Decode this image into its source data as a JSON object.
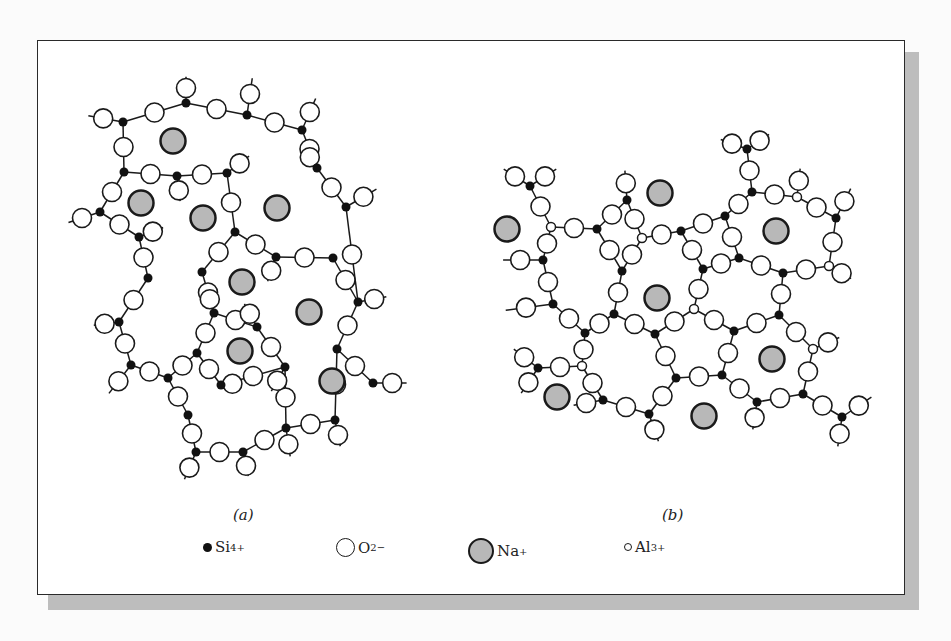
{
  "figure": {
    "panels": [
      {
        "id": "a",
        "caption": "(a)",
        "caption_pos": [
          243,
          516
        ]
      },
      {
        "id": "b",
        "caption": "(b)",
        "caption_pos": [
          672,
          516
        ]
      }
    ],
    "legend": [
      {
        "symbol": "si",
        "label": "Si",
        "charge": "4+",
        "x": 203
      },
      {
        "symbol": "o",
        "label": "O",
        "charge": "2−",
        "x": 336
      },
      {
        "symbol": "na",
        "label": "Na",
        "charge": "+",
        "x": 468
      },
      {
        "symbol": "al",
        "label": "Al",
        "charge": "3+",
        "x": 624
      }
    ],
    "colors": {
      "si": "#111111",
      "o_fill": "#ffffff",
      "na_fill": "#b8b8b8",
      "stroke": "#1a1a1a",
      "shadow": "#bdbdbd"
    }
  },
  "diagram_data": {
    "panel_a": {
      "title": "Sodium silicate glass network",
      "si": [
        [
          123,
          122
        ],
        [
          186,
          103
        ],
        [
          247,
          115
        ],
        [
          302,
          130
        ],
        [
          124,
          172
        ],
        [
          177,
          176
        ],
        [
          227,
          173
        ],
        [
          317,
          168
        ],
        [
          100,
          212
        ],
        [
          139,
          237
        ],
        [
          235,
          232
        ],
        [
          346,
          207
        ],
        [
          276,
          257
        ],
        [
          333,
          258
        ],
        [
          148,
          278
        ],
        [
          202,
          272
        ],
        [
          358,
          302
        ],
        [
          214,
          313
        ],
        [
          257,
          327
        ],
        [
          119,
          322
        ],
        [
          197,
          353
        ],
        [
          337,
          349
        ],
        [
          131,
          365
        ],
        [
          168,
          378
        ],
        [
          221,
          385
        ],
        [
          285,
          367
        ],
        [
          373,
          383
        ],
        [
          188,
          415
        ],
        [
          286,
          428
        ],
        [
          335,
          420
        ],
        [
          196,
          452
        ],
        [
          243,
          452
        ]
      ],
      "bonds": [
        [
          0,
          1
        ],
        [
          1,
          2
        ],
        [
          2,
          3
        ],
        [
          0,
          4
        ],
        [
          4,
          5
        ],
        [
          5,
          6
        ],
        [
          3,
          7
        ],
        [
          4,
          8
        ],
        [
          8,
          9
        ],
        [
          6,
          10
        ],
        [
          7,
          11
        ],
        [
          10,
          12
        ],
        [
          12,
          13
        ],
        [
          9,
          14
        ],
        [
          10,
          15
        ],
        [
          11,
          16
        ],
        [
          13,
          16
        ],
        [
          15,
          17
        ],
        [
          17,
          18
        ],
        [
          14,
          19
        ],
        [
          17,
          20
        ],
        [
          16,
          21
        ],
        [
          19,
          22
        ],
        [
          22,
          23
        ],
        [
          20,
          24
        ],
        [
          18,
          25
        ],
        [
          21,
          26
        ],
        [
          23,
          27
        ],
        [
          25,
          28
        ],
        [
          21,
          29
        ],
        [
          27,
          30
        ],
        [
          28,
          29
        ],
        [
          30,
          31
        ],
        [
          31,
          28
        ],
        [
          20,
          23
        ],
        [
          24,
          25
        ]
      ],
      "terminals": [
        [
          186,
          103,
          186,
          78
        ],
        [
          247,
          115,
          252,
          80
        ],
        [
          302,
          130,
          315,
          100
        ],
        [
          123,
          122,
          90,
          116
        ],
        [
          177,
          176,
          180,
          200
        ],
        [
          227,
          173,
          248,
          157
        ],
        [
          317,
          168,
          305,
          150
        ],
        [
          100,
          212,
          70,
          222
        ],
        [
          139,
          237,
          162,
          228
        ],
        [
          346,
          207,
          375,
          190
        ],
        [
          276,
          257,
          268,
          280
        ],
        [
          358,
          302,
          385,
          297
        ],
        [
          257,
          327,
          245,
          305
        ],
        [
          119,
          322,
          95,
          325
        ],
        [
          131,
          365,
          110,
          392
        ],
        [
          221,
          385,
          240,
          383
        ],
        [
          285,
          367,
          272,
          390
        ],
        [
          373,
          383,
          405,
          383
        ],
        [
          286,
          428,
          290,
          455
        ],
        [
          335,
          420,
          340,
          445
        ],
        [
          196,
          452,
          185,
          478
        ],
        [
          243,
          452,
          248,
          475
        ],
        [
          214,
          313,
          207,
          290
        ]
      ],
      "na": [
        [
          173,
          141
        ],
        [
          141,
          203
        ],
        [
          203,
          218
        ],
        [
          277,
          208
        ],
        [
          242,
          282
        ],
        [
          309,
          312
        ],
        [
          240,
          351
        ],
        [
          332,
          381
        ]
      ]
    },
    "panel_b": {
      "title": "Sodium aluminosilicate glass network",
      "si": [
        [
          530,
          186
        ],
        [
          597,
          229
        ],
        [
          627,
          200
        ],
        [
          543,
          260
        ],
        [
          622,
          271
        ],
        [
          553,
          304
        ],
        [
          614,
          314
        ],
        [
          585,
          333
        ],
        [
          655,
          334
        ],
        [
          681,
          231
        ],
        [
          703,
          269
        ],
        [
          725,
          216
        ],
        [
          752,
          192
        ],
        [
          747,
          149
        ],
        [
          739,
          258
        ],
        [
          783,
          273
        ],
        [
          836,
          218
        ],
        [
          779,
          315
        ],
        [
          734,
          331
        ],
        [
          538,
          368
        ],
        [
          603,
          400
        ],
        [
          649,
          414
        ],
        [
          676,
          378
        ],
        [
          722,
          375
        ],
        [
          757,
          402
        ],
        [
          803,
          394
        ],
        [
          842,
          417
        ]
      ],
      "al": [
        [
          551,
          227
        ],
        [
          642,
          238
        ],
        [
          694,
          309
        ],
        [
          797,
          197
        ],
        [
          829,
          266
        ],
        [
          813,
          349
        ],
        [
          582,
          366
        ]
      ],
      "bonds": [
        [
          "si0",
          "al0"
        ],
        [
          "al0",
          "si1"
        ],
        [
          "si1",
          "si2"
        ],
        [
          "si2",
          "al1"
        ],
        [
          "al1",
          "si9"
        ],
        [
          "al0",
          "si3"
        ],
        [
          "si3",
          "si5"
        ],
        [
          "si1",
          "si4"
        ],
        [
          "al1",
          "si4"
        ],
        [
          "si4",
          "si6"
        ],
        [
          "si5",
          "si7"
        ],
        [
          "si6",
          "si7"
        ],
        [
          "si6",
          "si8"
        ],
        [
          "si8",
          "al2"
        ],
        [
          "al2",
          "si10"
        ],
        [
          "si9",
          "si10"
        ],
        [
          "si9",
          "si11"
        ],
        [
          "si11",
          "si12"
        ],
        [
          "si12",
          "al3"
        ],
        [
          "al3",
          "si16"
        ],
        [
          "si12",
          "si13"
        ],
        [
          "si10",
          "si14"
        ],
        [
          "si11",
          "si14"
        ],
        [
          "si14",
          "si15"
        ],
        [
          "si15",
          "al4"
        ],
        [
          "al4",
          "si16"
        ],
        [
          "si15",
          "si17"
        ],
        [
          "si17",
          "si18"
        ],
        [
          "si18",
          "al2"
        ],
        [
          "si17",
          "al5"
        ],
        [
          "si7",
          "al6"
        ],
        [
          "al6",
          "si19"
        ],
        [
          "al6",
          "si20"
        ],
        [
          "si20",
          "si21"
        ],
        [
          "si8",
          "si22"
        ],
        [
          "si21",
          "si22"
        ],
        [
          "si22",
          "si23"
        ],
        [
          "si23",
          "si18"
        ],
        [
          "si23",
          "si24"
        ],
        [
          "si24",
          "si25"
        ],
        [
          "si25",
          "al5"
        ],
        [
          "si25",
          "si26"
        ]
      ],
      "terminals": [
        [
          530,
          186,
          505,
          170
        ],
        [
          530,
          186,
          555,
          170
        ],
        [
          627,
          200,
          625,
          172
        ],
        [
          543,
          260,
          505,
          260
        ],
        [
          553,
          304,
          508,
          310
        ],
        [
          538,
          368,
          515,
          350
        ],
        [
          538,
          368,
          522,
          392
        ],
        [
          603,
          400,
          575,
          405
        ],
        [
          649,
          414,
          658,
          440
        ],
        [
          747,
          149,
          722,
          140
        ],
        [
          747,
          149,
          768,
          135
        ],
        [
          797,
          197,
          800,
          170
        ],
        [
          836,
          218,
          850,
          190
        ],
        [
          829,
          266,
          850,
          278
        ],
        [
          813,
          349,
          838,
          338
        ],
        [
          757,
          402,
          753,
          428
        ],
        [
          842,
          417,
          870,
          398
        ],
        [
          842,
          417,
          838,
          445
        ]
      ],
      "na": [
        [
          507,
          229
        ],
        [
          660,
          193
        ],
        [
          776,
          231
        ],
        [
          657,
          298
        ],
        [
          772,
          359
        ],
        [
          557,
          397
        ],
        [
          704,
          416
        ]
      ]
    }
  }
}
